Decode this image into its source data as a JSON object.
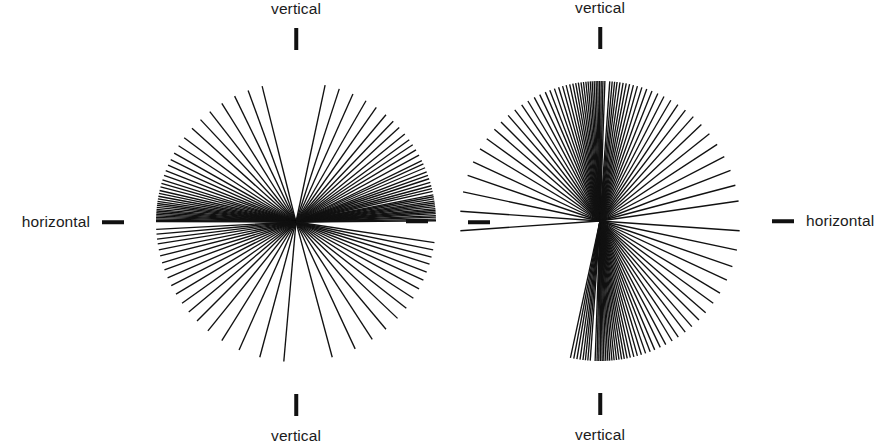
{
  "figure": {
    "background_color": "#ffffff",
    "line_color": "#111111",
    "text_color": "#1b1b1b"
  },
  "panels": [
    {
      "id": "left",
      "name": "horizontal-preferred-rose",
      "center": {
        "x": 296,
        "y": 222
      },
      "radius": 140,
      "labels": {
        "top": "vertical",
        "bottom": "vertical",
        "left": "horizontal",
        "right": ""
      },
      "ticks": {
        "top": true,
        "bottom": true,
        "left": true,
        "right": true
      }
    },
    {
      "id": "right",
      "name": "vertical-preferred-rose",
      "center": {
        "x": 600,
        "y": 221
      },
      "radius": 140,
      "labels": {
        "top": "vertical",
        "bottom": "vertical",
        "left": "",
        "right": "horizontal"
      },
      "ticks": {
        "top": true,
        "bottom": true,
        "left": true,
        "right": true
      }
    }
  ],
  "chart_data": [
    {
      "type": "rose",
      "id": "left-rose",
      "title": "",
      "xlabel": "",
      "ylabel": "",
      "description": "Radial line plot of measured lineation orientations; each datum drawn as a ray from the common centre. Modal direction is horizontal.",
      "angle_units": "degrees",
      "angle_reference": "0 = horizontal (right), angles increase counter-clockwise",
      "axis_labels": {
        "0": "horizontal",
        "90": "vertical",
        "180": "horizontal",
        "270": "vertical"
      },
      "preferred_orientation": "horizontal",
      "n": 104,
      "angles_deg": [
        0.5,
        1.2,
        2.0,
        2.6,
        3.4,
        4.1,
        4.8,
        5.5,
        6.3,
        7.0,
        7.8,
        8.6,
        9.5,
        10.4,
        11.2,
        12.6,
        13.8,
        15.0,
        16.4,
        18.0,
        19.5,
        21.0,
        22.8,
        24.5,
        26.0,
        28.5,
        31.0,
        33.5,
        36.0,
        39.0,
        42.5,
        46.0,
        50.0,
        55.0,
        60.0,
        66.0,
        72.0,
        78.0,
        104.0,
        110.0,
        116.0,
        122.0,
        128.0,
        133.0,
        138.0,
        143.0,
        147.0,
        150.5,
        153.5,
        156.0,
        158.5,
        160.5,
        162.5,
        164.0,
        165.5,
        167.0,
        168.2,
        169.4,
        170.5,
        171.5,
        172.4,
        173.2,
        174.0,
        174.8,
        175.5,
        176.2,
        176.9,
        177.5,
        178.1,
        178.7,
        179.3,
        179.8,
        183.0,
        185.0,
        187.0,
        189.0,
        191.5,
        194.0,
        197.0,
        200.0,
        203.5,
        207.0,
        211.0,
        215.5,
        220.0,
        225.0,
        231.0,
        238.0,
        246.0,
        255.0,
        265.0,
        285.0,
        295.0,
        303.0,
        310.0,
        316.5,
        322.0,
        327.0,
        331.5,
        335.5,
        339.0,
        342.5,
        345.5,
        348.5,
        351.5
      ],
      "lengths_norm": [
        1.0,
        1.0,
        1.0,
        1.0,
        1.0,
        1.0,
        1.0,
        1.0,
        1.0,
        1.0,
        1.0,
        1.0,
        1.0,
        1.0,
        1.0,
        1.0,
        1.0,
        1.0,
        1.0,
        1.0,
        1.0,
        1.0,
        1.0,
        1.0,
        1.0,
        1.0,
        1.0,
        1.0,
        1.0,
        1.0,
        1.0,
        1.0,
        1.0,
        1.0,
        1.0,
        1.0,
        1.0,
        1.0,
        1.0,
        1.0,
        1.0,
        1.0,
        1.0,
        1.0,
        1.0,
        1.0,
        1.0,
        1.0,
        1.0,
        1.0,
        1.0,
        1.0,
        1.0,
        1.0,
        1.0,
        1.0,
        1.0,
        1.0,
        1.0,
        1.0,
        1.0,
        1.0,
        1.0,
        1.0,
        1.0,
        1.0,
        1.0,
        1.0,
        1.0,
        1.0,
        1.0,
        1.0,
        1.0,
        1.0,
        1.0,
        1.0,
        1.0,
        1.0,
        1.0,
        1.0,
        1.0,
        1.0,
        1.0,
        1.0,
        1.0,
        1.0,
        1.0,
        1.0,
        1.0,
        1.0,
        1.0,
        1.0,
        1.0,
        1.0,
        1.0,
        1.0,
        1.0,
        1.0,
        1.0,
        1.0,
        1.0,
        1.0,
        1.0,
        1.0,
        1.0
      ]
    },
    {
      "type": "rose",
      "id": "right-rose",
      "title": "",
      "xlabel": "",
      "ylabel": "",
      "description": "Radial line plot of measured lineation orientations; each datum drawn as a ray from the common centre. Modal direction is vertical.",
      "angle_units": "degrees",
      "angle_reference": "0 = horizontal (right), angles increase counter-clockwise",
      "axis_labels": {
        "0": "horizontal",
        "90": "vertical",
        "180": "horizontal",
        "270": "vertical"
      },
      "preferred_orientation": "vertical",
      "n": 108,
      "angles_deg": [
        88.0,
        88.8,
        89.5,
        90.2,
        90.9,
        91.6,
        92.4,
        93.2,
        94.0,
        94.9,
        95.8,
        96.8,
        97.8,
        98.9,
        100.0,
        101.2,
        102.5,
        104.0,
        105.5,
        107.2,
        109.0,
        111.0,
        113.0,
        115.5,
        118.0,
        121.0,
        124.0,
        127.5,
        131.0,
        135.0,
        139.0,
        144.0,
        149.0,
        155.0,
        161.0,
        168.0,
        176.0,
        184.0,
        86.0,
        85.0,
        84.0,
        83.0,
        81.8,
        80.5,
        79.2,
        77.8,
        76.2,
        74.5,
        72.6,
        70.5,
        68.2,
        65.6,
        62.8,
        59.6,
        56.2,
        52.4,
        48.2,
        43.6,
        38.6,
        33.2,
        27.4,
        21.2,
        14.8,
        8.2,
        268.0,
        268.8,
        269.5,
        270.2,
        270.9,
        271.6,
        272.4,
        273.2,
        274.0,
        274.9,
        275.8,
        276.8,
        277.8,
        278.9,
        280.0,
        281.2,
        282.5,
        284.0,
        285.5,
        287.2,
        289.0,
        291.0,
        293.0,
        295.5,
        298.0,
        301.0,
        304.0,
        307.5,
        311.0,
        315.0,
        319.0,
        324.0,
        329.0,
        335.0,
        341.0,
        348.0,
        356.0,
        266.0,
        265.0,
        264.0,
        263.0,
        261.8,
        260.5,
        259.2,
        257.8
      ],
      "lengths_norm": [
        1.0,
        1.0,
        1.0,
        1.0,
        1.0,
        1.0,
        1.0,
        1.0,
        1.0,
        1.0,
        1.0,
        1.0,
        1.0,
        1.0,
        1.0,
        1.0,
        1.0,
        1.0,
        1.0,
        1.0,
        1.0,
        1.0,
        1.0,
        1.0,
        1.0,
        1.0,
        1.0,
        1.0,
        1.0,
        1.0,
        1.0,
        1.0,
        1.0,
        1.0,
        1.0,
        1.0,
        1.0,
        1.0,
        1.0,
        1.0,
        1.0,
        1.0,
        1.0,
        1.0,
        1.0,
        1.0,
        1.0,
        1.0,
        1.0,
        1.0,
        1.0,
        1.0,
        1.0,
        1.0,
        1.0,
        1.0,
        1.0,
        1.0,
        1.0,
        1.0,
        1.0,
        1.0,
        1.0,
        1.0,
        1.0,
        1.0,
        1.0,
        1.0,
        1.0,
        1.0,
        1.0,
        1.0,
        1.0,
        1.0,
        1.0,
        1.0,
        1.0,
        1.0,
        1.0,
        1.0,
        1.0,
        1.0,
        1.0,
        1.0,
        1.0,
        1.0,
        1.0,
        1.0,
        1.0,
        1.0,
        1.0,
        1.0,
        1.0,
        1.0,
        1.0,
        1.0,
        1.0,
        1.0,
        1.0,
        1.0,
        1.0,
        1.0,
        1.0,
        1.0,
        1.0,
        1.0,
        1.0,
        1.0,
        1.0
      ]
    }
  ]
}
